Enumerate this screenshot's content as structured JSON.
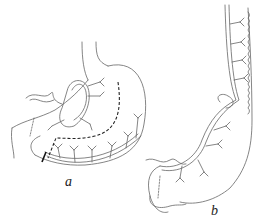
{
  "figure": {
    "panels": [
      {
        "id": "a",
        "label": "a",
        "description": "stomach with vascular arcades and dashed resection line"
      },
      {
        "id": "b",
        "label": "b",
        "description": "elongated gastric tube along greater curvature with vascular supply"
      }
    ],
    "colors": {
      "line": "#555555",
      "dashed": "#222222",
      "background": "#ffffff"
    }
  }
}
